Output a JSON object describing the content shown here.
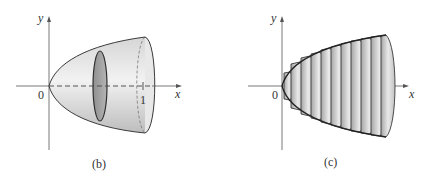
{
  "figures": [
    {
      "id": "b",
      "caption": "(b)",
      "axes": {
        "x_label": "x",
        "y_label": "y",
        "origin_label": "0",
        "tick_label": "1"
      },
      "description": "Solid of revolution with a single circular cross-section"
    },
    {
      "id": "c",
      "caption": "(c)",
      "axes": {
        "x_label": "x",
        "y_label": "y",
        "origin_label": "0"
      },
      "description": "Solid approximated by stacked thin disks",
      "disk_count": 12
    }
  ],
  "colors": {
    "outline": "#3a3a3a",
    "fill_light": "#e6e6e6",
    "fill_mid": "#c8c8c8",
    "fill_dark": "#9a9a9a",
    "axis": "#555555"
  }
}
